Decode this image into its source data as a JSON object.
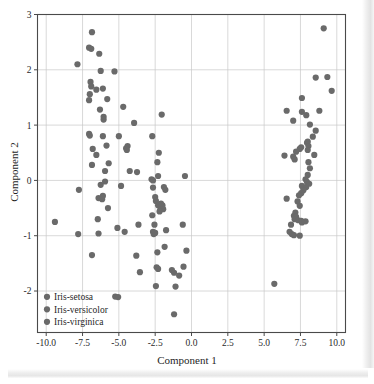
{
  "figure": {
    "background_color": "#ffffff",
    "frame_color": "#4a4a4a",
    "grid_color": "#c9c9c9",
    "marker_color": "#6a6a6a",
    "marker_radius": 3.1
  },
  "axis": {
    "x_title": "Component 1",
    "y_title": "Component 2",
    "x_ticks": [
      "-10.0",
      "-7.5",
      "-5.0",
      "-2.5",
      "0.0",
      "2.5",
      "5.0",
      "7.5",
      "10.0"
    ],
    "y_ticks": [
      "3",
      "2",
      "1",
      "0",
      "-1",
      "-2"
    ]
  },
  "legend": {
    "items": [
      {
        "label": "Iris-setosa",
        "color": "#6a6a6a"
      },
      {
        "label": "Iris-versicolor",
        "color": "#6a6a6a"
      },
      {
        "label": "Iris-virginica",
        "color": "#6a6a6a"
      }
    ]
  },
  "chart_data": {
    "type": "scatter",
    "title": "",
    "xlabel": "Component 1",
    "ylabel": "Component 2",
    "xlim": [
      -10.6,
      10.6
    ],
    "ylim": [
      -2.75,
      3.0
    ],
    "xticks": [
      -10.0,
      -7.5,
      -5.0,
      -2.5,
      0.0,
      2.5,
      5.0,
      7.5,
      10.0
    ],
    "yticks": [
      -2,
      -1,
      0,
      1,
      2,
      3
    ],
    "grid": true,
    "legend_position": "lower left",
    "marker_color": "#6a6a6a",
    "series": [
      {
        "name": "Iris-setosa",
        "color": "#6a6a6a",
        "points": [
          [
            -6.85,
            2.68
          ],
          [
            -7.05,
            2.4
          ],
          [
            -6.9,
            2.38
          ],
          [
            -6.35,
            2.29
          ],
          [
            -7.85,
            2.1
          ],
          [
            -6.25,
            1.98
          ],
          [
            -5.3,
            1.97
          ],
          [
            -6.95,
            1.78
          ],
          [
            -6.9,
            1.7
          ],
          [
            -6.55,
            1.64
          ],
          [
            -6.1,
            1.66
          ],
          [
            -7.0,
            1.56
          ],
          [
            -7.05,
            1.45
          ],
          [
            -5.8,
            1.47
          ],
          [
            -6.3,
            1.28
          ],
          [
            -6.05,
            1.15
          ],
          [
            -6.05,
            1.1
          ],
          [
            -4.7,
            1.33
          ],
          [
            -3.95,
            1.04
          ],
          [
            -7.05,
            0.84
          ],
          [
            -7.0,
            0.81
          ],
          [
            -6.1,
            0.8
          ],
          [
            -5.0,
            0.8
          ],
          [
            -6.8,
            0.57
          ],
          [
            -5.85,
            0.63
          ],
          [
            -6.55,
            0.46
          ],
          [
            -6.85,
            0.28
          ],
          [
            -4.4,
            0.62
          ],
          [
            -4.5,
            0.58
          ],
          [
            -4.45,
            0.55
          ],
          [
            -5.7,
            0.31
          ],
          [
            -4.25,
            0.17
          ],
          [
            -5.95,
            0.17
          ],
          [
            -3.75,
            0.15
          ],
          [
            -6.25,
            -0.08
          ],
          [
            -5.95,
            -0.02
          ],
          [
            -4.85,
            -0.1
          ],
          [
            -6.1,
            -0.28
          ],
          [
            -6.4,
            -0.32
          ],
          [
            -6.15,
            -0.34
          ],
          [
            -5.75,
            -0.5
          ],
          [
            -6.45,
            -0.7
          ],
          [
            -5.1,
            -0.86
          ],
          [
            -6.4,
            -0.96
          ],
          [
            -4.6,
            -0.93
          ],
          [
            -7.75,
            -0.17
          ],
          [
            -7.8,
            -0.97
          ],
          [
            -9.4,
            -0.75
          ],
          [
            -6.85,
            -1.35
          ],
          [
            -5.25,
            -2.1
          ],
          [
            -5.05,
            -2.11
          ]
        ]
      },
      {
        "name": "Iris-versicolor",
        "color": "#6a6a6a",
        "points": [
          [
            -2.05,
            1.19
          ],
          [
            -2.7,
            0.8
          ],
          [
            -2.25,
            0.5
          ],
          [
            -2.35,
            0.33
          ],
          [
            -2.75,
            0.02
          ],
          [
            -2.65,
            0.0
          ],
          [
            -2.3,
            0.08
          ],
          [
            -1.9,
            -0.12
          ],
          [
            -2.65,
            -0.13
          ],
          [
            -1.8,
            -0.17
          ],
          [
            -0.45,
            0.08
          ],
          [
            -2.5,
            -0.3
          ],
          [
            -2.45,
            -0.37
          ],
          [
            -2.7,
            -0.63
          ],
          [
            -2.3,
            -0.45
          ],
          [
            -2.15,
            -0.48
          ],
          [
            -2.05,
            -0.5
          ],
          [
            -1.95,
            -0.52
          ],
          [
            -2.0,
            -0.45
          ],
          [
            -2.1,
            -0.42
          ],
          [
            -2.2,
            -0.56
          ],
          [
            -2.55,
            -0.8
          ],
          [
            -2.65,
            -0.93
          ],
          [
            -2.6,
            -0.97
          ],
          [
            -2.5,
            -0.95
          ],
          [
            -1.75,
            -0.9
          ],
          [
            -0.6,
            -0.8
          ],
          [
            -3.65,
            -0.8
          ],
          [
            -3.8,
            -1.36
          ],
          [
            -2.35,
            -1.3
          ],
          [
            -1.85,
            -1.2
          ],
          [
            -2.4,
            -1.57
          ],
          [
            -2.3,
            -1.6
          ],
          [
            -1.35,
            -1.62
          ],
          [
            -1.2,
            -1.67
          ],
          [
            -0.55,
            -1.56
          ],
          [
            -0.85,
            -1.72
          ],
          [
            -3.55,
            -1.66
          ],
          [
            -2.45,
            -1.91
          ],
          [
            -1.1,
            -1.92
          ],
          [
            -0.35,
            -1.27
          ],
          [
            -1.2,
            -2.42
          ],
          [
            5.7,
            -1.87
          ]
        ]
      },
      {
        "name": "Iris-virginica",
        "color": "#6a6a6a",
        "points": [
          [
            9.1,
            2.75
          ],
          [
            9.65,
            1.62
          ],
          [
            8.55,
            1.86
          ],
          [
            9.35,
            1.87
          ],
          [
            7.6,
            1.49
          ],
          [
            8.8,
            1.26
          ],
          [
            6.55,
            1.26
          ],
          [
            7.6,
            1.24
          ],
          [
            7.9,
            1.18
          ],
          [
            7.0,
            1.08
          ],
          [
            8.15,
            1.01
          ],
          [
            8.55,
            0.9
          ],
          [
            8.35,
            0.79
          ],
          [
            8.0,
            0.7
          ],
          [
            7.95,
            0.68
          ],
          [
            8.05,
            0.62
          ],
          [
            7.55,
            0.6
          ],
          [
            7.45,
            0.57
          ],
          [
            8.0,
            0.55
          ],
          [
            7.2,
            0.52
          ],
          [
            8.45,
            0.46
          ],
          [
            6.4,
            0.45
          ],
          [
            7.0,
            0.43
          ],
          [
            7.1,
            0.38
          ],
          [
            8.05,
            0.33
          ],
          [
            8.15,
            0.22
          ],
          [
            8.0,
            0.1
          ],
          [
            7.85,
            0.02
          ],
          [
            7.95,
            -0.03
          ],
          [
            8.1,
            -0.06
          ],
          [
            7.6,
            -0.1
          ],
          [
            7.9,
            -0.12
          ],
          [
            7.7,
            -0.18
          ],
          [
            7.55,
            -0.23
          ],
          [
            7.4,
            -0.27
          ],
          [
            6.55,
            -0.33
          ],
          [
            7.3,
            -0.38
          ],
          [
            7.45,
            -0.46
          ],
          [
            7.15,
            -0.58
          ],
          [
            7.05,
            -0.64
          ],
          [
            7.2,
            -0.66
          ],
          [
            7.1,
            -0.7
          ],
          [
            7.35,
            -0.72
          ],
          [
            7.55,
            -0.73
          ],
          [
            7.85,
            -0.74
          ],
          [
            6.85,
            -0.8
          ],
          [
            6.75,
            -0.93
          ],
          [
            6.9,
            -0.97
          ],
          [
            7.05,
            -0.99
          ],
          [
            7.45,
            -1.0
          ],
          [
            7.6,
            -0.76
          ]
        ]
      }
    ]
  }
}
